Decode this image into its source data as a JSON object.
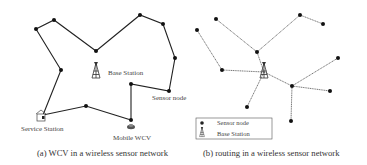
{
  "panel_a": {
    "caption": "(a) WCV in a wireless sensor network",
    "labels": {
      "base_station": "Base Station",
      "sensor_node": "Sensor node",
      "service_station": "Service Station",
      "mobile_wcv": "Mobile WCV"
    },
    "tour_nodes": [
      [
        43,
        115
      ],
      [
        61,
        70
      ],
      [
        36,
        29
      ],
      [
        54,
        20
      ],
      [
        96,
        51
      ],
      [
        140,
        15
      ],
      [
        163,
        24
      ],
      [
        175,
        58
      ],
      [
        169,
        91
      ],
      [
        131,
        84
      ],
      [
        131,
        120
      ],
      [
        86,
        106
      ],
      [
        43,
        115
      ]
    ],
    "base_station_pos": [
      96,
      72
    ],
    "edge_color": "#222222"
  },
  "panel_b": {
    "caption": "(b) routing in a wireless sensor network",
    "legend": {
      "sensor_node": "Sensor node",
      "base_station": "Base Station"
    },
    "base_station_pos": [
      264,
      72
    ],
    "nodes": [
      [
        197,
        30
      ],
      [
        216,
        19
      ],
      [
        257,
        52
      ],
      [
        222,
        70
      ],
      [
        300,
        15
      ],
      [
        323,
        24
      ],
      [
        338,
        58
      ],
      [
        292,
        86
      ],
      [
        330,
        91
      ],
      [
        291,
        121
      ],
      [
        247,
        107
      ]
    ],
    "edges": [
      [
        [
          197,
          30
        ],
        [
          222,
          70
        ]
      ],
      [
        [
          216,
          19
        ],
        [
          257,
          52
        ]
      ],
      [
        [
          257,
          52
        ],
        [
          264,
          72
        ]
      ],
      [
        [
          257,
          52
        ],
        [
          300,
          15
        ]
      ],
      [
        [
          300,
          15
        ],
        [
          323,
          24
        ]
      ],
      [
        [
          222,
          70
        ],
        [
          264,
          72
        ]
      ],
      [
        [
          264,
          72
        ],
        [
          292,
          86
        ]
      ],
      [
        [
          292,
          86
        ],
        [
          338,
          58
        ]
      ],
      [
        [
          292,
          86
        ],
        [
          330,
          91
        ]
      ],
      [
        [
          292,
          86
        ],
        [
          291,
          121
        ]
      ],
      [
        [
          264,
          72
        ],
        [
          247,
          107
        ]
      ]
    ],
    "edge_color": "#555555"
  }
}
